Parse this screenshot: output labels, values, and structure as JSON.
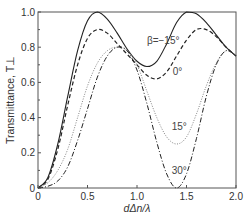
{
  "chart_data": {
    "type": "line",
    "title": "",
    "xlabel": "dΔn/λ",
    "ylabel": "Transmittance, T⊥",
    "xlim": [
      0,
      2.0
    ],
    "ylim": [
      0,
      1.0
    ],
    "xticks": [
      0,
      0.5,
      1.0,
      1.5,
      2.0
    ],
    "xtick_labels": [
      "0",
      "0.5",
      "1.0",
      "1.5",
      "2.0"
    ],
    "yticks": [
      0,
      0.2,
      0.4,
      0.6,
      0.8,
      1.0
    ],
    "ytick_labels": [
      "0",
      "0.2",
      "0.4",
      "0.6",
      "0.8",
      "1.0"
    ],
    "grid": false,
    "legend": "inline annotations",
    "series": [
      {
        "name": "β=−15°",
        "label": "β=−15°",
        "style": "solid",
        "x": [
          0,
          0.1,
          0.2,
          0.3,
          0.4,
          0.5,
          0.6,
          0.7,
          0.8,
          0.9,
          1.0,
          1.1,
          1.2,
          1.3,
          1.4,
          1.5,
          1.6,
          1.7,
          1.8,
          1.9,
          2.0
        ],
        "y": [
          0,
          0.06,
          0.25,
          0.52,
          0.78,
          0.95,
          1.0,
          0.96,
          0.88,
          0.79,
          0.72,
          0.69,
          0.72,
          0.82,
          0.94,
          1.0,
          0.99,
          0.94,
          0.87,
          0.8,
          0.75
        ]
      },
      {
        "name": "0°",
        "label": "0°",
        "style": "dashed",
        "x": [
          0,
          0.1,
          0.2,
          0.3,
          0.4,
          0.5,
          0.6,
          0.7,
          0.8,
          0.9,
          1.0,
          1.1,
          1.2,
          1.3,
          1.4,
          1.5,
          1.6,
          1.7,
          1.8,
          1.9,
          2.0
        ],
        "y": [
          0,
          0.05,
          0.22,
          0.47,
          0.7,
          0.85,
          0.9,
          0.88,
          0.82,
          0.76,
          0.7,
          0.64,
          0.62,
          0.66,
          0.75,
          0.84,
          0.9,
          0.9,
          0.86,
          0.8,
          0.75
        ]
      },
      {
        "name": "15°",
        "label": "15°",
        "style": "dotted",
        "x": [
          0,
          0.1,
          0.2,
          0.3,
          0.4,
          0.5,
          0.6,
          0.7,
          0.8,
          0.9,
          1.0,
          1.1,
          1.2,
          1.3,
          1.4,
          1.5,
          1.6,
          1.7,
          1.8,
          1.9,
          2.0
        ],
        "y": [
          0,
          0.03,
          0.1,
          0.22,
          0.4,
          0.58,
          0.71,
          0.78,
          0.8,
          0.78,
          0.7,
          0.55,
          0.4,
          0.29,
          0.25,
          0.29,
          0.42,
          0.58,
          0.71,
          0.78,
          0.75
        ]
      },
      {
        "name": "30°",
        "label": "30°",
        "style": "dash-dot",
        "x": [
          0,
          0.1,
          0.2,
          0.3,
          0.4,
          0.5,
          0.6,
          0.7,
          0.8,
          0.9,
          1.0,
          1.1,
          1.2,
          1.3,
          1.4,
          1.5,
          1.6,
          1.7,
          1.8,
          1.9,
          2.0
        ],
        "y": [
          0,
          0.01,
          0.04,
          0.12,
          0.27,
          0.45,
          0.63,
          0.75,
          0.8,
          0.78,
          0.67,
          0.48,
          0.26,
          0.08,
          0.0,
          0.08,
          0.28,
          0.52,
          0.7,
          0.78,
          0.75
        ]
      }
    ],
    "annotations": [
      {
        "text": "β=−15°",
        "x": 1.1,
        "y": 0.82
      },
      {
        "text": "0°",
        "x": 1.36,
        "y": 0.64
      },
      {
        "text": "15°",
        "x": 1.35,
        "y": 0.33
      },
      {
        "text": "30°",
        "x": 1.35,
        "y": 0.08
      }
    ]
  },
  "colors": {
    "line": "#222222",
    "axis": "#555555",
    "text": "#333333"
  }
}
